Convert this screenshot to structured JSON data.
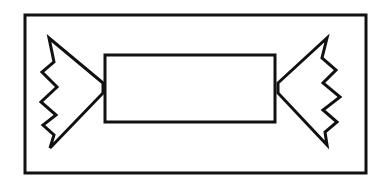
{
  "drawing": {
    "subject": "wrapped-candy",
    "stroke_color": "#111111",
    "background": "#ffffff",
    "frame": {
      "x": 25,
      "y": 15,
      "width": 341,
      "height": 158
    },
    "candy_body": {
      "x": 105,
      "y": 55,
      "width": 170,
      "height": 67
    },
    "left_wrapper_points": "103,83 49,38 54,62 42,72 57,87 41,102 56,115 43,125 54,135 50,148 103,93",
    "right_wrapper_points": "278,83 327,38 322,58 336,70 323,83 340,97 323,110 337,122 325,132 327,145 278,93"
  }
}
